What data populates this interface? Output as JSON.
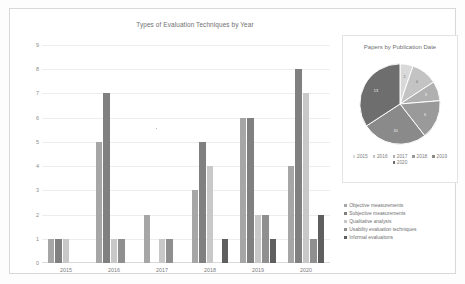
{
  "chart_data": [
    {
      "type": "bar",
      "title": "Types of Evaluation Techniques by Year",
      "xlabel": "",
      "ylabel": "",
      "ylim": [
        0,
        9
      ],
      "yticks": [
        "0",
        "1",
        "2",
        "3",
        "4",
        "5",
        "6",
        "7",
        "8",
        "9"
      ],
      "grid": true,
      "legend_position": "right",
      "categories": [
        "2015",
        "2016",
        "2017",
        "2018",
        "2019",
        "2020"
      ],
      "series": [
        {
          "name": "Objective measurements",
          "color": "#a6a6a6",
          "values": [
            1,
            5,
            2,
            3,
            6,
            4
          ]
        },
        {
          "name": "Subjective measurements",
          "color": "#808080",
          "values": [
            1,
            7,
            0,
            5,
            6,
            8
          ]
        },
        {
          "name": "Qualitative analysis",
          "color": "#c8c8c8",
          "values": [
            1,
            1,
            1,
            4,
            2,
            7
          ]
        },
        {
          "name": "Usability evaluation techniques",
          "color": "#8f8f8f",
          "values": [
            0,
            1,
            1,
            0,
            2,
            1
          ]
        },
        {
          "name": "Informal evaluaitons",
          "color": "#5f5f5f",
          "values": [
            0,
            0,
            0,
            1,
            1,
            2
          ]
        }
      ]
    },
    {
      "type": "pie",
      "title": "Papers by Publication Date",
      "legend_position": "bottom",
      "labels": [
        "2015",
        "2016",
        "2017",
        "2018",
        "2019",
        "2020"
      ],
      "values": [
        2,
        4,
        3,
        6,
        10,
        13
      ],
      "colors": [
        "#d9d9d9",
        "#c3c3c3",
        "#b0b0b0",
        "#9a9a9a",
        "#8a8a8a",
        "#6e6e6e"
      ]
    }
  ],
  "bar_chart": {
    "title": "Types of Evaluation Techniques by Year",
    "yticks": [
      "9",
      "8",
      "7",
      "6",
      "5",
      "4",
      "3",
      "2",
      "1",
      "0"
    ],
    "xlabels": [
      "2015",
      "2016",
      "2017",
      "2018",
      "2019",
      "2020"
    ],
    "legend": [
      {
        "label": "Objective measurements",
        "color": "#a6a6a6"
      },
      {
        "label": "Subjective measurements",
        "color": "#808080"
      },
      {
        "label": "Qualitative analysis",
        "color": "#c8c8c8"
      },
      {
        "label": "Usability evaluation techniques",
        "color": "#8f8f8f"
      },
      {
        "label": "Informal evaluaitons",
        "color": "#5f5f5f"
      }
    ]
  },
  "pie_chart": {
    "title": "Papers by Publication Date",
    "slices": [
      {
        "label": "2015",
        "value": "2",
        "color": "#d9d9d9"
      },
      {
        "label": "2016",
        "value": "4",
        "color": "#c3c3c3"
      },
      {
        "label": "2017",
        "value": "3",
        "color": "#b0b0b0"
      },
      {
        "label": "2018",
        "value": "6",
        "color": "#9a9a9a"
      },
      {
        "label": "2019",
        "value": "10",
        "color": "#8a8a8a"
      },
      {
        "label": "2020",
        "value": "13",
        "color": "#6e6e6e"
      }
    ]
  }
}
